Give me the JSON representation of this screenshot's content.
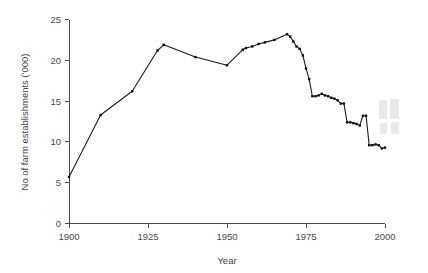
{
  "chart_data": {
    "type": "line",
    "title": "",
    "xlabel": "Year",
    "ylabel": "No of farm establishments ('000)",
    "xlim": [
      1900,
      2000
    ],
    "ylim": [
      0,
      25
    ],
    "xticks": [
      1900,
      1925,
      1950,
      1975,
      2000
    ],
    "yticks": [
      0,
      5,
      10,
      15,
      20,
      25
    ],
    "grid": false,
    "legend": false,
    "marker": "square",
    "x": [
      1900,
      1910,
      1920,
      1928,
      1930,
      1940,
      1950,
      1955,
      1956,
      1958,
      1960,
      1962,
      1965,
      1969,
      1970,
      1971,
      1972,
      1973,
      1974,
      1975,
      1976,
      1977,
      1978,
      1979,
      1980,
      1981,
      1982,
      1983,
      1984,
      1985,
      1986,
      1987,
      1988,
      1989,
      1990,
      1991,
      1992,
      1993,
      1994,
      1995,
      1996,
      1997,
      1998,
      1999,
      2000
    ],
    "values": [
      5.7,
      13.3,
      16.2,
      21.2,
      21.9,
      20.4,
      19.4,
      21.3,
      21.5,
      21.7,
      22.0,
      22.2,
      22.5,
      23.2,
      22.9,
      22.3,
      21.7,
      21.4,
      20.6,
      19.0,
      17.7,
      15.6,
      15.6,
      15.7,
      15.9,
      15.7,
      15.6,
      15.4,
      15.3,
      15.1,
      14.7,
      14.7,
      12.4,
      12.4,
      12.3,
      12.2,
      12.0,
      13.2,
      13.2,
      9.6,
      9.6,
      9.7,
      9.6,
      9.2,
      9.3
    ]
  },
  "axis": {
    "x_tick_labels": [
      "1900",
      "1925",
      "1950",
      "1975",
      "2000"
    ],
    "y_tick_labels": [
      "0",
      "5",
      "10",
      "15",
      "20",
      "25"
    ],
    "x_axis_title": "Year",
    "y_axis_title": "No of farm establishments ('000)"
  },
  "colors": {
    "line": "#1c1c1c",
    "axis": "#4d4d4d",
    "text": "#3f3f3f",
    "background": "#ffffff"
  }
}
